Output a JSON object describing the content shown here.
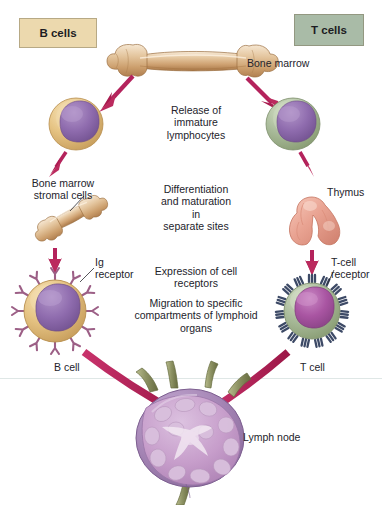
{
  "diagram": {
    "background": "#ffffff"
  },
  "headers": {
    "b_cells": {
      "label": "B cells",
      "color": "#ecd9ae"
    },
    "t_cells": {
      "label": "T cells",
      "color": "#a9bba7"
    }
  },
  "center_steps": {
    "step1": "Release of\nimmature\nlymphocytes",
    "step2": "Differentiation\nand maturation\nin\nseparate sites",
    "step3": "Expression of cell\nreceptors",
    "step4": "Migration to specific\ncompartments of lymphoid\norgans"
  },
  "labels": {
    "bone_marrow": "Bone marrow",
    "stromal_cells": "Bone marrow\nstromal cells",
    "thymus": "Thymus",
    "ig_receptor": "Ig\nreceptor",
    "tcell_receptor": "T-cell\nreceptor",
    "b_cell": "B cell",
    "t_cell": "T cell",
    "lymph_node": "Lymph node"
  },
  "colors": {
    "arrow": "#b4235c",
    "bone": "#d8a878",
    "bone_light": "#f0dcc0",
    "b_cytoplasm": "#e8c municipality"
  },
  "palette": {
    "arrow_crimson": "#b4235c",
    "bone_tan": "#d9ae82",
    "bone_highlight": "#f5e6cf",
    "b_cell_cytoplasm": "#e3bf7e",
    "b_cell_nucleus": "#8e6aa8",
    "b_receptor": "#9c5f86",
    "t_cell_cytoplasm": "#a8bb9a",
    "t_cell_nucleus": "#a855a0",
    "t_receptor": "#3d4a66",
    "thymus_pink": "#e8a695",
    "lymph_node_purple": "#a585b5",
    "lymph_vessel": "#8d9263",
    "text": "#23232b"
  },
  "elements": {
    "bone_marrow_icon": "long-bone",
    "stromal_bone_icon": "small-bone",
    "thymus_icon": "bilobed-thymus",
    "lymph_node_icon": "lymph-node-cross-section",
    "immature_b_lymphocyte": "immature-b-cell",
    "immature_t_lymphocyte": "immature-t-cell",
    "mature_b_cell": "mature-b-cell-with-ig-receptors",
    "mature_t_cell": "mature-t-cell-with-tcr"
  }
}
